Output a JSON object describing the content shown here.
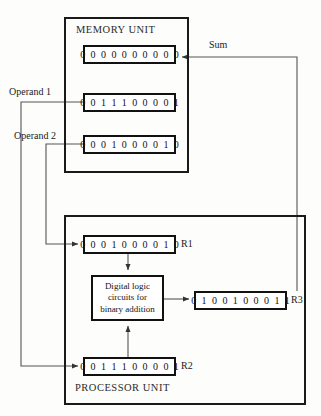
{
  "diagram": {
    "units": {
      "memory": {
        "title": "MEMORY UNIT"
      },
      "processor": {
        "title": "PROCESSOR UNIT"
      }
    },
    "memory_registers": [
      {
        "name": "sum-destination",
        "value": "0 0 0 0 0 0 0 0 0 0"
      },
      {
        "name": "operand-1-source",
        "value": "0 0 1 1 1 0 0 0 0 1"
      },
      {
        "name": "operand-2-source",
        "value": "0 0 0 1 0 0 0 0 1 0"
      }
    ],
    "processor_registers": [
      {
        "tag": "R1",
        "value": "0 0 0 1 0 0 0 0 1 0"
      },
      {
        "tag": "R2",
        "value": "0 0 1 1 1 0 0 0 0 1"
      },
      {
        "tag": "R3",
        "value": "0 1 0 0 1 0 0 0 1 1"
      }
    ],
    "logic_block": {
      "line1": "Digital logic",
      "line2": "circuits for",
      "line3": "binary addition"
    },
    "wire_labels": {
      "operand_1": "Operand 1",
      "operand_2": "Operand 2",
      "sum": "Sum"
    },
    "colors": {
      "ink": "#111111",
      "wire": "#555555",
      "background": "#fdfdfb"
    }
  }
}
